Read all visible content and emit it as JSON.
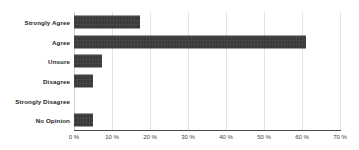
{
  "chart_data": {
    "type": "bar",
    "orientation": "horizontal",
    "title": "",
    "subtitle": "",
    "xlabel": "",
    "ylabel": "",
    "categories": [
      "Strongly Agree",
      "Agree",
      "Unsure",
      "Disagree",
      "Strongly Disagree",
      "No Opinion"
    ],
    "values": [
      17.4,
      61.0,
      7.4,
      5.1,
      0,
      5.1
    ],
    "value_unit": "%",
    "xlim": [
      0,
      70
    ],
    "xtick_values": [
      0,
      10,
      20,
      30,
      40,
      50,
      60,
      70
    ],
    "xtick_labels": [
      "0 %",
      "10 %",
      "20 %",
      "30 %",
      "40 %",
      "50 %",
      "60 %",
      "70 %"
    ],
    "grid": true,
    "grid_axis": "x",
    "legend": false,
    "legend_position": "none",
    "bar_color": "#3a3a3a",
    "gridline_color": "#e3e3e3",
    "axis_color": "#4a4a4a",
    "background_color": "#ffffff",
    "label_color": "#262626"
  }
}
